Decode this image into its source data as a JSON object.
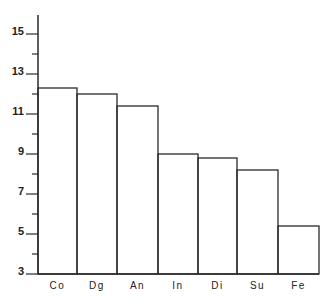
{
  "chart_data": {
    "type": "bar",
    "title": "",
    "xlabel": "",
    "ylabel": "",
    "categories": [
      "Co",
      "Dg",
      "An",
      "In",
      "Di",
      "Su",
      "Fe"
    ],
    "values": [
      12.3,
      12.0,
      11.4,
      9.0,
      8.8,
      8.2,
      5.4
    ],
    "ylim": [
      3,
      16
    ],
    "yticks_labeled": [
      3,
      5,
      7,
      9,
      11,
      13,
      15
    ],
    "yticks_minor": [
      4,
      6,
      8,
      10,
      12,
      14
    ],
    "grid": false,
    "legend": null,
    "bar_style": "outlined, no fill, adjacent"
  },
  "colors": {
    "stroke": "#2a2a2a",
    "background": "#ffffff"
  }
}
